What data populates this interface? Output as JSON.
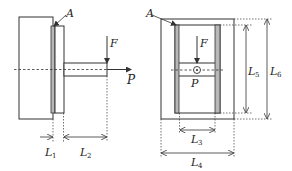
{
  "diagram": {
    "left_view": {
      "labels": {
        "A": "A",
        "F": "F",
        "P": "P",
        "L1_main": "L",
        "L1_sub": "1",
        "L2_main": "L",
        "L2_sub": "2"
      }
    },
    "right_view": {
      "labels": {
        "A": "A",
        "F": "F",
        "P": "P",
        "L3_main": "L",
        "L3_sub": "3",
        "L4_main": "L",
        "L4_sub": "4",
        "L5_main": "L",
        "L5_sub": "5",
        "L6_main": "L",
        "L6_sub": "6"
      }
    },
    "colors": {
      "line": "#333333",
      "adhesive_fill": "#b8b8b8",
      "background": "#ffffff"
    }
  }
}
